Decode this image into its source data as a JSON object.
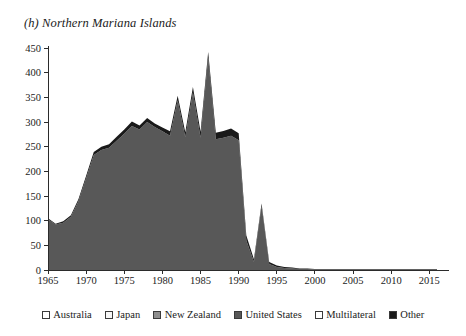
{
  "chart_data": {
    "type": "area",
    "title": "(h) Northern Mariana Islands",
    "xlabel": "",
    "ylabel": "",
    "xlim": [
      1965,
      2016
    ],
    "ylim": [
      -50,
      450
    ],
    "ytick_step": 50,
    "xtick_step": 5,
    "grid": false,
    "stacked": true,
    "legend_position": "bottom",
    "xticks": [
      "1965",
      "1970",
      "1975",
      "1980",
      "1985",
      "1990",
      "1995",
      "2000",
      "2005",
      "2010",
      "2015"
    ],
    "yticks": [
      "-50",
      "0",
      "50",
      "100",
      "150",
      "200",
      "250",
      "300",
      "350",
      "400",
      "450"
    ],
    "x": [
      1965,
      1966,
      1967,
      1968,
      1969,
      1970,
      1971,
      1972,
      1973,
      1974,
      1975,
      1976,
      1977,
      1978,
      1979,
      1980,
      1981,
      1982,
      1983,
      1984,
      1985,
      1986,
      1987,
      1988,
      1989,
      1990,
      1991,
      1992,
      1993,
      1994,
      1995,
      1996,
      1997,
      1998,
      1999,
      2000,
      2001,
      2002,
      2003,
      2004,
      2005,
      2006,
      2007,
      2008,
      2009,
      2010,
      2011,
      2012,
      2013,
      2014,
      2015,
      2016
    ],
    "series": [
      {
        "name": "Australia",
        "color": "#ffffff",
        "values": [
          0,
          0,
          0,
          0,
          0,
          0,
          0,
          0,
          0,
          0,
          0,
          0,
          0,
          0,
          0,
          0,
          0,
          0,
          0,
          0,
          0,
          0,
          0,
          0,
          0,
          0,
          0,
          0,
          0,
          0,
          0,
          0,
          0,
          0,
          0,
          0,
          0,
          0,
          0,
          0,
          0,
          0,
          0,
          0,
          0,
          0,
          0,
          0,
          0,
          0,
          0,
          0
        ]
      },
      {
        "name": "Japan",
        "color": "#f2f2f2",
        "values": [
          0,
          0,
          0,
          0,
          0,
          0,
          0,
          0,
          0,
          0,
          0,
          0,
          0,
          0,
          0,
          0,
          0,
          0,
          0,
          0,
          0,
          0,
          0,
          0,
          0,
          0,
          0,
          0,
          0,
          0,
          0,
          0,
          0,
          0,
          0,
          0,
          0,
          0,
          0,
          0,
          0,
          0,
          0,
          0,
          0,
          0,
          0,
          0,
          0,
          0,
          0,
          0
        ]
      },
      {
        "name": "New Zealand",
        "color": "#9a9a9a",
        "values": [
          0,
          0,
          0,
          0,
          0,
          0,
          0,
          0,
          0,
          0,
          0,
          0,
          0,
          0,
          0,
          0,
          0,
          0,
          0,
          0,
          0,
          0,
          0,
          0,
          0,
          0,
          0,
          0,
          0,
          0,
          0,
          0,
          0,
          0,
          0,
          0,
          0,
          0,
          0,
          0,
          0,
          0,
          0,
          0,
          0,
          0,
          0,
          0,
          0,
          0,
          0,
          0
        ]
      },
      {
        "name": "United States",
        "color": "#585858",
        "values": [
          103,
          92,
          96,
          108,
          140,
          186,
          233,
          243,
          248,
          262,
          276,
          292,
          285,
          300,
          290,
          281,
          272,
          344,
          269,
          360,
          268,
          430,
          265,
          268,
          272,
          263,
          60,
          16,
          130,
          12,
          6,
          4,
          3,
          2,
          2,
          1,
          1,
          1,
          1,
          1,
          1,
          1,
          1,
          1,
          1,
          1,
          1,
          1,
          1,
          1,
          1,
          1
        ]
      },
      {
        "name": "Multilateral",
        "color": "#ffffff",
        "values": [
          0,
          0,
          0,
          0,
          0,
          0,
          0,
          0,
          0,
          0,
          0,
          0,
          0,
          0,
          0,
          0,
          0,
          0,
          0,
          0,
          0,
          0,
          0,
          0,
          0,
          0,
          0,
          0,
          0,
          0,
          0,
          0,
          0,
          0,
          0,
          0,
          0,
          0,
          0,
          0,
          0,
          0,
          0,
          0,
          0,
          0,
          0,
          0,
          0,
          0,
          0,
          0
        ]
      },
      {
        "name": "Other",
        "color": "#1a1a1a",
        "values": [
          2,
          2,
          3,
          3,
          4,
          5,
          6,
          7,
          7,
          8,
          9,
          9,
          8,
          8,
          7,
          8,
          9,
          9,
          10,
          11,
          12,
          12,
          13,
          14,
          15,
          14,
          10,
          6,
          5,
          4,
          3,
          2,
          2,
          1,
          1,
          1,
          1,
          1,
          1,
          1,
          1,
          1,
          1,
          1,
          1,
          1,
          1,
          1,
          1,
          1,
          1,
          1
        ]
      }
    ]
  },
  "legend": {
    "items": [
      {
        "label": "Australia",
        "swatch": "#ffffff"
      },
      {
        "label": "Japan",
        "swatch": "#f7f7f7"
      },
      {
        "label": "New Zealand",
        "swatch": "#8e8e8e"
      },
      {
        "label": "United States",
        "swatch": "#585858"
      },
      {
        "label": "Multilateral",
        "swatch": "#ffffff"
      },
      {
        "label": "Other",
        "swatch": "#1a1a1a"
      }
    ]
  }
}
